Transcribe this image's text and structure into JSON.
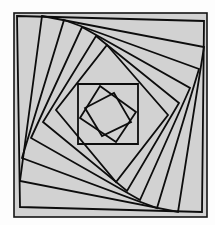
{
  "figure": {
    "title": "Whirling nested squares spiral",
    "kind": "geometric-line-figure",
    "canvas": {
      "width": 215,
      "height": 225
    },
    "colors": {
      "page_background": "#fdfdfd",
      "panel_background": "#d2d2d2",
      "line_color": "#0d0d0d",
      "frame_color": "#141414"
    },
    "frame": {
      "x": 14,
      "y": 13,
      "width": 193,
      "height": 204,
      "stroke_width": 1.6
    },
    "construction": {
      "description": "Each successive square is inscribed in the previous one, with every vertex placed at a constant fraction t along each edge, producing a counterclockwise whirling spiral.",
      "square_count": 10,
      "inset_fraction_t": 0.135,
      "rotation_direction": "counterclockwise",
      "stroke_width": 1.8,
      "center": {
        "x": 110,
        "y": 114
      }
    },
    "chart_data": {
      "type": "line",
      "title": "Whirling nested squares spiral",
      "xlabel": "",
      "ylabel": "",
      "xlim": [
        14,
        207
      ],
      "ylim": [
        13,
        217
      ],
      "grid": false,
      "legend": "none",
      "series": [
        {
          "name": "square-1",
          "closed": true,
          "points": [
            [
              17,
              16
            ],
            [
              204,
              21
            ],
            [
              202,
              212
            ],
            [
              20,
              207
            ]
          ]
        },
        {
          "name": "square-2",
          "closed": true,
          "points": [
            [
              42,
              16
            ],
            [
              204,
              47
            ],
            [
              178,
              212
            ],
            [
              20,
              181
            ]
          ]
        },
        {
          "name": "square-3",
          "closed": true,
          "points": [
            [
              64,
              20
            ],
            [
              199,
              69
            ],
            [
              157,
              208
            ],
            [
              22,
              158
            ]
          ]
        },
        {
          "name": "square-4",
          "closed": true,
          "points": [
            [
              82,
              27
            ],
            [
              190,
              88
            ],
            [
              140,
              200
            ],
            [
              31,
              138
            ]
          ]
        },
        {
          "name": "square-5",
          "closed": true,
          "points": [
            [
              96,
              36
            ],
            [
              179,
              103
            ],
            [
              127,
              191
            ],
            [
              43,
              122
            ]
          ]
        },
        {
          "name": "square-6",
          "closed": true,
          "points": [
            [
              107,
              45
            ],
            [
              168,
              115
            ],
            [
              116,
              182
            ],
            [
              56,
              110
            ]
          ]
        },
        {
          "name": "square-7",
          "closed": true,
          "points": [
            [
              78,
              84
            ],
            [
              138,
              84
            ],
            [
              138,
              144
            ],
            [
              78,
              144
            ]
          ]
        },
        {
          "name": "square-8",
          "closed": true,
          "points": [
            [
              100,
              86
            ],
            [
              136,
              112
            ],
            [
              116,
              142
            ],
            [
              80,
              118
            ]
          ]
        },
        {
          "name": "square-9",
          "closed": true,
          "points": [
            [
              114,
              93
            ],
            [
              131,
              122
            ],
            [
              102,
              136
            ],
            [
              85,
              108
            ]
          ]
        }
      ]
    }
  }
}
